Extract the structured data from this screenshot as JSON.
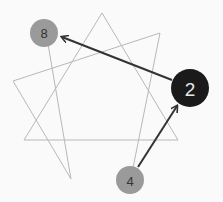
{
  "diagram": {
    "type": "enneagram-heptagram-lines",
    "colors": {
      "background": "#fafafa",
      "star_line": "#b8b8b8",
      "arrow": "#333333",
      "node_grey": "#9a9a9a",
      "node_active": "#1a1a1a",
      "label_dark": "#333333",
      "label_light": "#e8e8e8"
    },
    "star_points": [
      {
        "x": 102,
        "y": 13
      },
      {
        "x": 160,
        "y": 33
      },
      {
        "x": 13,
        "y": 81
      },
      {
        "x": 24,
        "y": 140
      },
      {
        "x": 178,
        "y": 140
      },
      {
        "x": 71,
        "y": 179
      }
    ],
    "nodes": [
      {
        "id": "node-8",
        "label": "8",
        "x": 44,
        "y": 33,
        "r": 14,
        "fill": "#9a9a9a",
        "text_color": "#333333"
      },
      {
        "id": "node-2",
        "label": "2",
        "x": 190,
        "y": 88,
        "r": 19,
        "fill": "#1a1a1a",
        "text_color": "#e8e8e8"
      },
      {
        "id": "node-4",
        "label": "4",
        "x": 130,
        "y": 180,
        "r": 14,
        "fill": "#9a9a9a",
        "text_color": "#333333"
      }
    ],
    "arrows": [
      {
        "from": "2",
        "to": "8"
      },
      {
        "from": "4",
        "to": "2"
      }
    ]
  }
}
